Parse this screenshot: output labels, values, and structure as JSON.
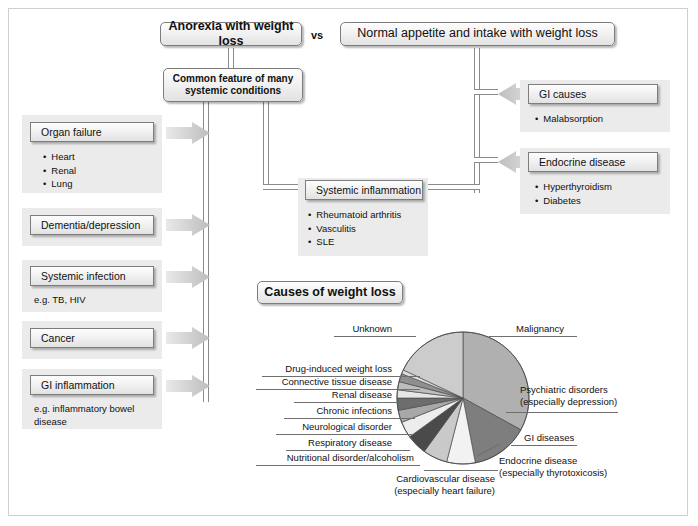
{
  "title_boxes": {
    "left": "Anorexia with weight loss",
    "vs": "vs",
    "right": "Normal appetite and intake with weight loss"
  },
  "common_feature_box": {
    "line1": "Common feature of many",
    "line2": "systemic conditions"
  },
  "left_column": [
    {
      "heading": "Organ failure",
      "bullets": [
        "Heart",
        "Renal",
        "Lung"
      ],
      "note": ""
    },
    {
      "heading": "Dementia/depression",
      "bullets": [],
      "note": ""
    },
    {
      "heading": "Systemic infection",
      "bullets": [],
      "note": "e.g. TB, HIV"
    },
    {
      "heading": "Cancer",
      "bullets": [],
      "note": ""
    },
    {
      "heading": "GI inflammation",
      "bullets": [],
      "note": "e.g. inflammatory bowel\ndisease"
    }
  ],
  "middle_node": {
    "heading": "Systemic inflammation",
    "bullets": [
      "Rheumatoid arthritis",
      "Vasculitis",
      "SLE"
    ]
  },
  "right_column": [
    {
      "heading": "GI causes",
      "bullets": [
        "Malabsorption"
      ]
    },
    {
      "heading": "Endocrine disease",
      "bullets": [
        "Hyperthyroidism",
        "Diabetes"
      ]
    }
  ],
  "pie_title": "Causes of weight loss",
  "chart_data": {
    "type": "pie",
    "title": "Causes of weight loss",
    "legend": "labels-with-leader-lines",
    "grid": false,
    "start_angle_deg": 0,
    "direction": "clockwise",
    "labels": [
      "Malignancy",
      "Psychiatric disorders\n(especially depression)",
      "GI diseases",
      "Endocrine disease\n(especially thyrotoxicosis)",
      "Cardiovascular disease\n(especially heart failure)",
      "Nutritional disorder/alcoholism",
      "Respiratory disease",
      "Neurological disorder",
      "Chronic infections",
      "Renal disease",
      "Connective tissue disease",
      "Drug-induced weight loss",
      "Unknown"
    ],
    "categories": [
      "Malignancy",
      "Psychiatric disorders",
      "GI diseases",
      "Endocrine disease",
      "Cardiovascular disease",
      "Nutritional disorder/alcoholism",
      "Respiratory disease",
      "Neurological disorder",
      "Chronic infections",
      "Renal disease",
      "Connective tissue disease",
      "Drug-induced weight loss",
      "Unknown"
    ],
    "values": [
      33,
      14,
      7,
      6,
      5,
      4,
      3,
      3,
      2,
      2,
      2,
      1,
      18
    ],
    "units": "percent",
    "colors": [
      "#b0b0b0",
      "#7e7e7e",
      "#f2f2f2",
      "#c9c9c9",
      "#4a4a4a",
      "#ededed",
      "#a8a8a8",
      "#6d6d6d",
      "#e6e6e6",
      "#bdbdbd",
      "#8f8f8f",
      "#dcdcdc",
      "#cccccc"
    ]
  },
  "pie_labels_left": [
    "Drug-induced weight loss",
    "Connective tissue disease",
    "Renal disease",
    "Chronic infections",
    "Neurological disorder",
    "Respiratory disease",
    "Nutritional disorder/alcoholism"
  ],
  "pie_label_unknown": "Unknown",
  "pie_label_malignancy": "Malignancy",
  "pie_label_psych_l1": "Psychiatric disorders",
  "pie_label_psych_l2": "(especially depression)",
  "pie_label_gi": "GI diseases",
  "pie_label_endo_l1": "Endocrine disease",
  "pie_label_endo_l2": "(especially thyrotoxicosis)",
  "pie_label_cardio_l1": "Cardiovascular disease",
  "pie_label_cardio_l2": "(especially heart failure)",
  "colors": {
    "panel": "#ebebeb",
    "box_border": "#7d7d7d",
    "arrow": "#c9c9c9",
    "connector": "#8a8a8a",
    "frame": "#cfcfcf"
  }
}
